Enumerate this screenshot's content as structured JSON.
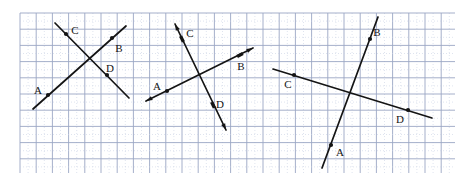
{
  "figure": {
    "kind": "geometry-diagram",
    "paper": {
      "background_color": "#ffffff",
      "ink_color": "#141414",
      "major_grid_color": "#9ba6c4",
      "minor_grid_color": "#c9d2e4",
      "grid_spacing_px": 16.2,
      "grid_left_px": 20,
      "grid_top_px": 13,
      "grid_right_px": 455,
      "grid_bottom_px": 173,
      "label_font_size_px": 11
    }
  },
  "diagrams": [
    {
      "name": "diagram-1",
      "style": "plain-segments-with-dots",
      "lines": [
        {
          "name": "line-AB",
          "from_label": "A",
          "to_label": "B",
          "x1": 33,
          "y1": 109,
          "x2": 126,
          "y2": 26,
          "arrow_start": false,
          "arrow_end": false,
          "points": [
            {
              "label": "A",
              "dot": true,
              "px": 48,
              "py": 95,
              "lx": 38,
              "ly": 90
            },
            {
              "label": "B",
              "dot": true,
              "px": 112,
              "py": 38,
              "lx": 119,
              "ly": 48
            }
          ]
        },
        {
          "name": "line-CD",
          "from_label": "C",
          "to_label": "D",
          "x1": 55,
          "y1": 23,
          "x2": 129,
          "y2": 98,
          "arrow_start": false,
          "arrow_end": false,
          "points": [
            {
              "label": "C",
              "dot": true,
              "px": 66,
              "py": 34,
              "lx": 75,
              "ly": 30
            },
            {
              "label": "D",
              "dot": true,
              "px": 107,
              "py": 75,
              "lx": 110,
              "ly": 68
            }
          ]
        }
      ]
    },
    {
      "name": "diagram-2",
      "style": "double-arrow-lines-with-dots",
      "lines": [
        {
          "name": "line-AB",
          "from_label": "A",
          "to_label": "B",
          "x1": 146,
          "y1": 101,
          "x2": 253,
          "y2": 48,
          "arrow_start": true,
          "arrow_end": true,
          "points": [
            {
              "label": "A",
              "dot": true,
              "px": 167,
              "py": 91,
              "lx": 157,
              "ly": 86
            },
            {
              "label": "B",
              "dot": false,
              "px": 240,
              "py": 55,
              "lx": 241,
              "ly": 66
            }
          ]
        },
        {
          "name": "line-CD",
          "from_label": "C",
          "to_label": "D",
          "x1": 175,
          "y1": 24,
          "x2": 226,
          "y2": 130,
          "arrow_start": true,
          "arrow_end": true,
          "points": [
            {
              "label": "C",
              "dot": false,
              "px": 182,
              "py": 39,
              "lx": 190,
              "ly": 33
            },
            {
              "label": "D",
              "dot": false,
              "px": 213,
              "py": 105,
              "lx": 220,
              "ly": 104
            }
          ]
        }
      ]
    },
    {
      "name": "diagram-3",
      "style": "plain-segments-with-dots",
      "lines": [
        {
          "name": "line-AB",
          "from_label": "A",
          "to_label": "B",
          "x1": 322,
          "y1": 168,
          "x2": 378,
          "y2": 17,
          "arrow_start": false,
          "arrow_end": false,
          "points": [
            {
              "label": "A",
              "dot": true,
              "px": 331,
              "py": 145,
              "lx": 340,
              "ly": 152
            },
            {
              "label": "B",
              "dot": true,
              "px": 370,
              "py": 39,
              "lx": 377,
              "ly": 32
            }
          ]
        },
        {
          "name": "line-CD",
          "from_label": "C",
          "to_label": "D",
          "x1": 273,
          "y1": 69,
          "x2": 432,
          "y2": 118,
          "arrow_start": false,
          "arrow_end": false,
          "points": [
            {
              "label": "C",
              "dot": true,
              "px": 294,
              "py": 75,
              "lx": 288,
              "ly": 84
            },
            {
              "label": "D",
              "dot": true,
              "px": 408,
              "py": 110,
              "lx": 400,
              "ly": 119
            }
          ]
        }
      ]
    }
  ]
}
